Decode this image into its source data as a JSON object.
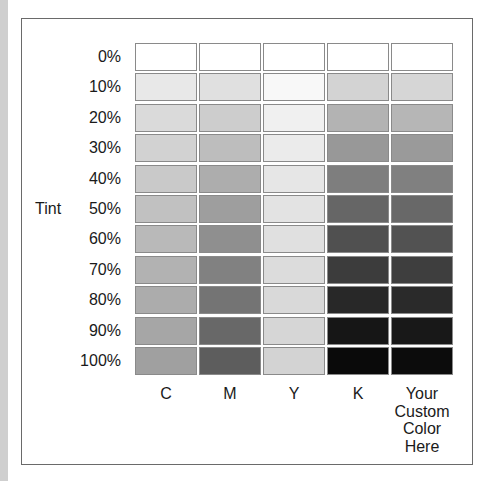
{
  "axis": {
    "label": "Tint"
  },
  "rows": [
    "0%",
    "10%",
    "20%",
    "30%",
    "40%",
    "50%",
    "60%",
    "70%",
    "80%",
    "90%",
    "100%"
  ],
  "columns": [
    {
      "label": "C",
      "lines": [
        "C"
      ]
    },
    {
      "label": "M",
      "lines": [
        "M"
      ]
    },
    {
      "label": "Y",
      "lines": [
        "Y"
      ]
    },
    {
      "label": "K",
      "lines": [
        "K"
      ]
    },
    {
      "label": "Your Custom Color Here",
      "lines": [
        "Your",
        "Custom",
        "Color",
        "Here"
      ]
    }
  ],
  "swatches": {
    "C": [
      "#ffffff",
      "#e8e8e8",
      "#dadada",
      "#d2d2d2",
      "#c9c9c9",
      "#c1c1c1",
      "#b9b9b9",
      "#b2b2b2",
      "#acacac",
      "#a6a6a6",
      "#a0a0a0"
    ],
    "M": [
      "#ffffff",
      "#e0e0e0",
      "#cdcdcd",
      "#bdbdbd",
      "#adadad",
      "#9e9e9e",
      "#8f8f8f",
      "#818181",
      "#747474",
      "#686868",
      "#5d5d5d"
    ],
    "Y": [
      "#ffffff",
      "#f8f8f8",
      "#f0f0f0",
      "#ebebeb",
      "#e6e6e6",
      "#e3e3e3",
      "#e0e0e0",
      "#dcdcdc",
      "#d9d9d9",
      "#d6d6d6",
      "#d3d3d3"
    ],
    "K": [
      "#ffffff",
      "#d3d3d3",
      "#b3b3b3",
      "#989898",
      "#7e7e7e",
      "#666666",
      "#505050",
      "#3c3c3c",
      "#282828",
      "#161616",
      "#0a0a0a"
    ],
    "Custom": [
      "#ffffff",
      "#d6d6d6",
      "#b6b6b6",
      "#9a9a9a",
      "#808080",
      "#686868",
      "#525252",
      "#3e3e3e",
      "#2a2a2a",
      "#181818",
      "#0c0c0c"
    ]
  },
  "colors": {
    "frame_border": "#6a6a6a",
    "cell_border": "#8a8a8a",
    "left_strip": "#cfcfcf"
  }
}
